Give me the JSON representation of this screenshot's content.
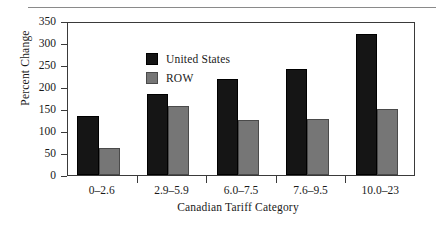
{
  "chart_data": {
    "type": "bar",
    "title": "",
    "xlabel": "Canadian Tariff Category",
    "ylabel": "Percent Change",
    "categories": [
      "0–2.6",
      "2.9–5.9",
      "6.0–7.5",
      "7.6–9.5",
      "10.0–23"
    ],
    "series": [
      {
        "name": "United States",
        "color": "#151515",
        "values": [
          135,
          185,
          219,
          241,
          320
        ]
      },
      {
        "name": "ROW",
        "color": "#767676",
        "values": [
          62,
          156,
          126,
          127,
          151
        ]
      }
    ],
    "ylim": [
      0,
      350
    ],
    "yticks": [
      0,
      50,
      100,
      150,
      200,
      250,
      300,
      350
    ],
    "ytick_labels": [
      "0",
      "50",
      "100",
      "150",
      "200",
      "250",
      "300",
      "350"
    ],
    "grid": false,
    "legend_position": "top-left"
  },
  "legend": {
    "items": [
      {
        "label": "United States",
        "swatch": "black-square-swatch"
      },
      {
        "label": "ROW",
        "swatch": "gray-square-swatch"
      }
    ]
  }
}
